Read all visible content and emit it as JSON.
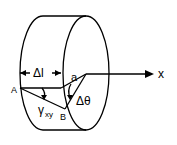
{
  "diagram": {
    "type": "torsion-shear-strain-cylinder",
    "labels": {
      "point_A": "A",
      "point_a": "a",
      "point_B": "B",
      "length": "Δl",
      "shear_strain_symbol": "γ",
      "shear_strain_subscript": "xy",
      "twist_angle": "Δθ",
      "axis": "x"
    },
    "colors": {
      "stroke": "#000000",
      "background": "#ffffff"
    }
  }
}
